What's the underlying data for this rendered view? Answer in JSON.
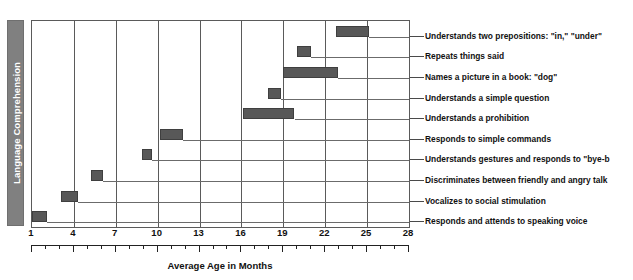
{
  "chart_data": {
    "type": "bar",
    "orientation": "horizontal",
    "subtype": "range-bar",
    "title": "Language Comprehension",
    "xlabel": "Average Age in Months",
    "ylabel": "",
    "xlim": [
      1,
      28
    ],
    "grid": true,
    "legend": false,
    "legend_position": "none",
    "xticks": [
      1,
      4,
      7,
      10,
      13,
      16,
      19,
      22,
      25,
      28
    ],
    "xtick_labels": [
      "1",
      "4",
      "7",
      "10",
      "13",
      "16",
      "19",
      "22",
      "25",
      "28"
    ],
    "minor_tick_interval": 1,
    "categories": [
      "Understands two prepositions: \"in,\" \"under\"",
      "Repeats things said",
      "Names a picture in a book: \"dog\"",
      "Understands a simple question",
      "Understands a prohibition",
      "Responds to simple commands",
      "Understands gestures and responds to \"bye-b",
      "Discriminates between friendly and angry talk",
      "Vocalizes to social stimulation",
      "Responds and attends to speaking voice"
    ],
    "bars": [
      {
        "label": "Understands two prepositions: \"in,\" \"under\"",
        "start": 22.8,
        "end": 25.1
      },
      {
        "label": "Repeats things said",
        "start": 20.0,
        "end": 21.0
      },
      {
        "label": "Names a picture in a book: \"dog\"",
        "start": 19.0,
        "end": 22.9
      },
      {
        "label": "Understands a simple question",
        "start": 17.9,
        "end": 18.8
      },
      {
        "label": "Understands a prohibition",
        "start": 16.1,
        "end": 19.8
      },
      {
        "label": "Responds to simple commands",
        "start": 10.2,
        "end": 11.8
      },
      {
        "label": "Understands gestures and responds to \"bye-b",
        "start": 8.9,
        "end": 9.6
      },
      {
        "label": "Discriminates between friendly and angry talk",
        "start": 5.2,
        "end": 6.1
      },
      {
        "label": "Vocalizes to social stimulation",
        "start": 3.1,
        "end": 4.3
      },
      {
        "label": "Responds and attends to speaking voice",
        "start": 1.0,
        "end": 2.1
      }
    ],
    "colors": {
      "bar_fill": "#585858",
      "bar_border": "#3f3f3f",
      "grid": "#5a5a5a",
      "row_line": "#6b6b6b",
      "band_fill": "#808080",
      "band_text": "#ffffff",
      "text": "#111111",
      "background": "#ffffff"
    }
  }
}
